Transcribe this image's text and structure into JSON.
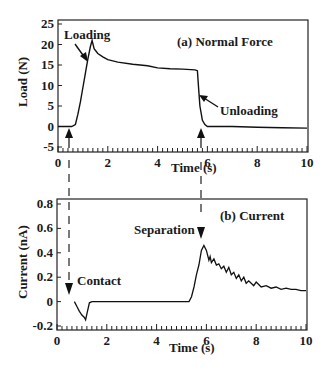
{
  "chart_data": [
    {
      "type": "line",
      "title": "(a) Normal Force",
      "xlabel": "Time (s)",
      "ylabel": "Load (N)",
      "xlim": [
        0,
        10
      ],
      "ylim": [
        -5,
        25
      ],
      "xticks": [
        "0",
        "2",
        "4",
        "6",
        "8",
        "10"
      ],
      "yticks": [
        "-5",
        "0",
        "5",
        "10",
        "15",
        "20",
        "25"
      ],
      "grid": false,
      "series": [
        {
          "name": "Normal Force",
          "x": [
            0.0,
            0.3,
            0.55,
            0.7,
            0.8,
            0.9,
            1.0,
            1.1,
            1.2,
            1.3,
            1.37,
            1.45,
            1.6,
            1.8,
            2.0,
            2.4,
            3.0,
            3.6,
            4.0,
            4.5,
            5.0,
            5.5,
            5.6,
            5.65,
            5.7,
            5.8,
            5.9,
            6.0,
            6.5,
            7.0,
            8.0,
            9.0,
            10.0
          ],
          "y": [
            0,
            0,
            0,
            0.5,
            3,
            6,
            9.5,
            13,
            16.5,
            19.5,
            21,
            19,
            17.8,
            17,
            16.3,
            15.7,
            15.2,
            14.8,
            14.3,
            14.1,
            14.0,
            13.8,
            13.6,
            9,
            5,
            1.5,
            0.5,
            0,
            0,
            0,
            -0.2,
            -0.3,
            -0.4
          ]
        }
      ],
      "annotations": [
        {
          "text": "Loading",
          "x": 1.2,
          "y": 16
        },
        {
          "text": "Unloading",
          "x": 5.7,
          "y": 3
        },
        {
          "text": "arrow-up",
          "x": 0.45,
          "y": 0
        },
        {
          "text": "arrow-up",
          "x": 5.85,
          "y": 0
        }
      ]
    },
    {
      "type": "line",
      "title": "(b) Current",
      "xlabel": "Time (s)",
      "ylabel": "Current (nA)",
      "xlim": [
        0,
        10
      ],
      "ylim": [
        -0.2,
        0.8
      ],
      "xticks": [
        "0",
        "2",
        "4",
        "6",
        "8",
        "10"
      ],
      "yticks": [
        "-0.2",
        "0",
        "0.2",
        "0.4",
        "0.6",
        "0.8"
      ],
      "grid": false,
      "series": [
        {
          "name": "Current",
          "x": [
            0.7,
            0.8,
            0.9,
            1.0,
            1.1,
            1.15,
            1.2,
            1.3,
            1.4,
            2.0,
            3.0,
            4.0,
            5.0,
            5.3,
            5.4,
            5.5,
            5.6,
            5.7,
            5.8,
            5.9,
            6.0,
            6.1,
            6.15,
            6.2,
            6.3,
            6.4,
            6.5,
            6.6,
            6.7,
            6.8,
            6.9,
            7.0,
            7.1,
            7.2,
            7.3,
            7.4,
            7.5,
            7.6,
            7.7,
            7.8,
            7.9,
            8.0,
            8.2,
            8.4,
            8.6,
            8.8,
            9.0,
            9.2,
            9.4,
            9.6,
            9.8,
            10.0
          ],
          "y": [
            0,
            -0.04,
            -0.08,
            -0.11,
            -0.13,
            -0.15,
            -0.1,
            -0.01,
            0,
            0,
            0,
            0,
            0,
            0.0,
            0.04,
            0.12,
            0.22,
            0.3,
            0.42,
            0.46,
            0.42,
            0.34,
            0.37,
            0.32,
            0.35,
            0.3,
            0.31,
            0.27,
            0.29,
            0.24,
            0.28,
            0.22,
            0.24,
            0.19,
            0.22,
            0.17,
            0.2,
            0.15,
            0.17,
            0.15,
            0.13,
            0.16,
            0.12,
            0.13,
            0.11,
            0.12,
            0.1,
            0.11,
            0.1,
            0.1,
            0.09,
            0.09
          ]
        }
      ],
      "annotations": [
        {
          "text": "Contact",
          "x": 0.45,
          "y": 0.15
        },
        {
          "text": "Separation",
          "x": 5.85,
          "y": 0.6
        },
        {
          "text": "arrow-down",
          "x": 0.45,
          "y": 0.05
        },
        {
          "text": "arrow-down",
          "x": 5.85,
          "y": 0.55
        }
      ]
    }
  ],
  "labels": {
    "top_title": "(a) Normal Force",
    "top_ylabel": "Load (N)",
    "top_xlabel": "Time (s)",
    "top_loading": "Loading",
    "top_unloading": "Unloading",
    "bottom_title": "(b)  Current",
    "bottom_ylabel": "Current (nA)",
    "bottom_xlabel": "Time (s)",
    "bottom_contact": "Contact",
    "bottom_separation": "Separation"
  }
}
